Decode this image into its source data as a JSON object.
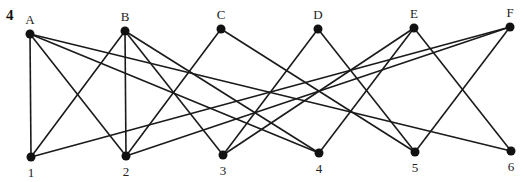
{
  "question_number": "4",
  "top_nodes": [
    {
      "id": "A",
      "label": "A",
      "x": 30,
      "y": 34
    },
    {
      "id": "B",
      "label": "B",
      "x": 125,
      "y": 31
    },
    {
      "id": "C",
      "label": "C",
      "x": 221,
      "y": 29
    },
    {
      "id": "D",
      "label": "D",
      "x": 318,
      "y": 29
    },
    {
      "id": "E",
      "label": "E",
      "x": 414,
      "y": 28
    },
    {
      "id": "F",
      "label": "F",
      "x": 510,
      "y": 27
    }
  ],
  "bottom_nodes": [
    {
      "id": "1",
      "label": "1",
      "x": 31,
      "y": 157
    },
    {
      "id": "2",
      "label": "2",
      "x": 126,
      "y": 156
    },
    {
      "id": "3",
      "label": "3",
      "x": 223,
      "y": 155
    },
    {
      "id": "4",
      "label": "4",
      "x": 319,
      "y": 153
    },
    {
      "id": "5",
      "label": "5",
      "x": 415,
      "y": 152
    },
    {
      "id": "6",
      "label": "6",
      "x": 511,
      "y": 151
    }
  ],
  "edges": [
    [
      "A",
      "1"
    ],
    [
      "A",
      "2"
    ],
    [
      "A",
      "4"
    ],
    [
      "A",
      "6"
    ],
    [
      "B",
      "1"
    ],
    [
      "B",
      "2"
    ],
    [
      "B",
      "3"
    ],
    [
      "B",
      "4"
    ],
    [
      "C",
      "2"
    ],
    [
      "C",
      "5"
    ],
    [
      "D",
      "3"
    ],
    [
      "D",
      "5"
    ],
    [
      "E",
      "3"
    ],
    [
      "E",
      "4"
    ],
    [
      "E",
      "6"
    ],
    [
      "F",
      "1"
    ],
    [
      "F",
      "2"
    ],
    [
      "F",
      "5"
    ]
  ]
}
